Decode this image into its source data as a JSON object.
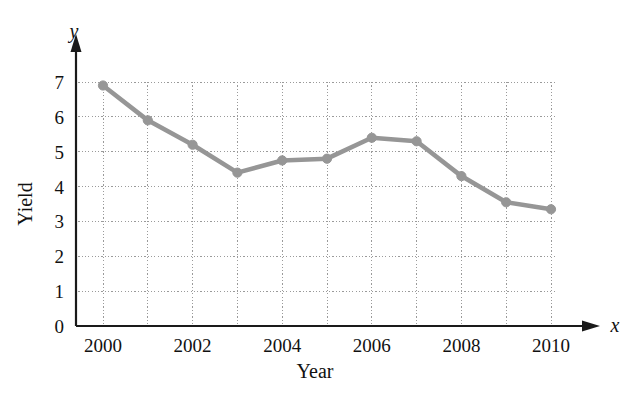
{
  "chart_data": {
    "type": "line",
    "title": "",
    "subtitle": "",
    "xlabel": "Year",
    "ylabel": "Yield",
    "x_axis_name": "x",
    "y_axis_name": "y",
    "x": [
      2000,
      2001,
      2002,
      2003,
      2004,
      2005,
      2006,
      2007,
      2008,
      2009,
      2010
    ],
    "values": [
      6.9,
      5.9,
      5.2,
      4.4,
      4.75,
      4.8,
      5.4,
      5.3,
      4.3,
      3.55,
      3.35
    ],
    "series": [
      {
        "name": "Yield",
        "values": [
          6.9,
          5.9,
          5.2,
          4.4,
          4.75,
          4.8,
          5.4,
          5.3,
          4.3,
          3.55,
          3.35
        ]
      }
    ],
    "xlim": [
      2000,
      2010
    ],
    "ylim": [
      0,
      7
    ],
    "x_tick_labels": [
      "2000",
      "2002",
      "2004",
      "2006",
      "2008",
      "2010"
    ],
    "x_tick_values": [
      2000,
      2002,
      2004,
      2006,
      2008,
      2010
    ],
    "y_tick_labels": [
      "0",
      "1",
      "2",
      "3",
      "4",
      "5",
      "6",
      "7"
    ],
    "y_tick_values": [
      0,
      1,
      2,
      3,
      4,
      5,
      6,
      7
    ],
    "grid": true,
    "grid_style": "dotted",
    "legend": false,
    "legend_position": "none",
    "series_color": "#969696",
    "marker": "circle",
    "grid_color": "#9a9a9a",
    "axis_color": "#1a1a1a"
  }
}
